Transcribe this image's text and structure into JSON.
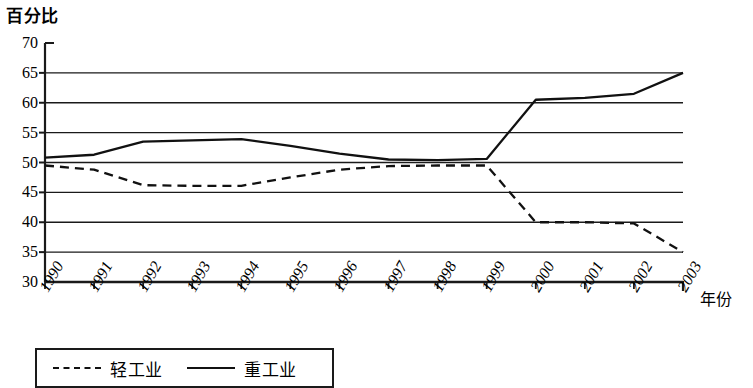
{
  "chart_data": {
    "type": "line",
    "title": "",
    "ylabel": "百分比",
    "xlabel": "年份",
    "grid": true,
    "ylim": [
      30,
      70
    ],
    "ytick_step": 5,
    "yticks": [
      70,
      65,
      60,
      55,
      50,
      45,
      40,
      35,
      30
    ],
    "ytick_labels": [
      "70",
      "65",
      "60",
      "55",
      "50",
      "45",
      "40",
      "35",
      "30"
    ],
    "categories": [
      "1990",
      "1991",
      "1992",
      "1993",
      "1994",
      "1995",
      "1996",
      "1997",
      "1998",
      "1999",
      "2000",
      "2001",
      "2002",
      "2003"
    ],
    "legend_position": "below-left",
    "series": [
      {
        "name": "轻工业",
        "style": "dashed",
        "color": "#111111",
        "values": [
          49.5,
          48.8,
          46.2,
          46.1,
          46.1,
          47.5,
          48.8,
          49.4,
          49.5,
          49.5,
          40.0,
          40.0,
          39.8,
          35.0
        ]
      },
      {
        "name": "重工业",
        "style": "solid",
        "color": "#111111",
        "values": [
          50.8,
          51.3,
          53.5,
          53.7,
          53.9,
          52.8,
          51.5,
          50.5,
          50.4,
          50.6,
          60.5,
          60.8,
          61.5,
          65.0
        ]
      }
    ]
  }
}
